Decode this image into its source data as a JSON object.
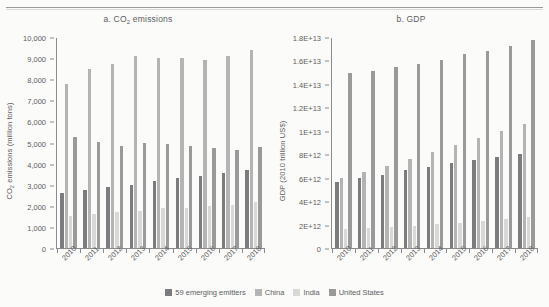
{
  "figure": {
    "panels": [
      {
        "key": "co2",
        "title_prefix": "a. CO",
        "title_sub": "2",
        "title_suffix": " emissions",
        "ytitle_prefix": "CO",
        "ytitle_sub": "2",
        "ytitle_suffix": " emissions (million tons)",
        "yticks": [
          "10,000",
          "9,000",
          "8,000",
          "7,000",
          "6,000",
          "5,000",
          "4,000",
          "3,000",
          "2,000",
          "1,000",
          "0"
        ]
      },
      {
        "key": "gdp",
        "title_prefix": "b. GDP",
        "title_sub": "",
        "title_suffix": "",
        "ytitle_prefix": "GDP (2010 trillion US$)",
        "ytitle_sub": "",
        "ytitle_suffix": "",
        "yticks": [
          "1.8E+13",
          "1.6E+13",
          "1.4E+13",
          "1.2E+13",
          "1E+13",
          "8E+12",
          "6E+12",
          "4E+12",
          "2E+12",
          "0"
        ]
      }
    ],
    "legend": [
      {
        "label": "59 emerging emitters",
        "color": "#7c7c7e"
      },
      {
        "label": "China",
        "color": "#b4b4b4"
      },
      {
        "label": "India",
        "color": "#d8d8d6"
      },
      {
        "label": "United States",
        "color": "#9a9a9a"
      }
    ]
  },
  "chart_data": [
    {
      "type": "bar",
      "title": "a. CO2 emissions",
      "xlabel": "",
      "ylabel": "CO2 emissions (million tons)",
      "ylim": [
        0,
        10000
      ],
      "ytick_step": 1000,
      "grid": false,
      "legend_position": "bottom",
      "categories": [
        "2010",
        "2011",
        "2012",
        "2013",
        "2014",
        "2015",
        "2016",
        "2017",
        "2018"
      ],
      "series": [
        {
          "name": "59 emerging emitters",
          "color": "#7c7c7e",
          "values": [
            2670,
            2810,
            2950,
            3030,
            3220,
            3360,
            3470,
            3610,
            3730
          ]
        },
        {
          "name": "China",
          "color": "#b4b4b4",
          "values": [
            7830,
            8530,
            8780,
            9130,
            9060,
            9030,
            8980,
            9150,
            9430
          ]
        },
        {
          "name": "India",
          "color": "#d8d8d6",
          "values": [
            1560,
            1660,
            1760,
            1820,
            1960,
            1960,
            2020,
            2100,
            2250
          ]
        },
        {
          "name": "United States",
          "color": "#9a9a9a",
          "values": [
            5330,
            5080,
            4880,
            5010,
            5000,
            4880,
            4780,
            4680,
            4840
          ]
        }
      ]
    },
    {
      "type": "bar",
      "title": "b. GDP",
      "xlabel": "",
      "ylabel": "GDP (2010 trillion US$)",
      "ylim": [
        0,
        18000000000000
      ],
      "ytick_step": 2000000000000,
      "grid": false,
      "legend_position": "bottom",
      "categories": [
        "2010",
        "2011",
        "2012",
        "2013",
        "2014",
        "2015",
        "2016",
        "2017",
        "2018"
      ],
      "series": [
        {
          "name": "59 emerging emitters",
          "color": "#7c7c7e",
          "values": [
            5700000000000.0,
            6050000000000.0,
            6350000000000.0,
            6700000000000.0,
            7000000000000.0,
            7350000000000.0,
            7600000000000.0,
            7850000000000.0,
            8100000000000.0
          ]
        },
        {
          "name": "China",
          "color": "#b4b4b4",
          "values": [
            6100000000000.0,
            6550000000000.0,
            7050000000000.0,
            7650000000000.0,
            8250000000000.0,
            8900000000000.0,
            9500000000000.0,
            10100000000000.0,
            10700000000000.0
          ]
        },
        {
          "name": "India",
          "color": "#d8d8d6",
          "values": [
            1700000000000.0,
            1780000000000.0,
            1860000000000.0,
            1960000000000.0,
            2100000000000.0,
            2250000000000.0,
            2420000000000.0,
            2580000000000.0,
            2750000000000.0
          ]
        },
        {
          "name": "United States",
          "color": "#9a9a9a",
          "values": [
            15000000000000.0,
            15200000000000.0,
            15500000000000.0,
            15800000000000.0,
            16100000000000.0,
            16600000000000.0,
            16900000000000.0,
            17300000000000.0,
            17800000000000.0
          ]
        }
      ]
    }
  ]
}
